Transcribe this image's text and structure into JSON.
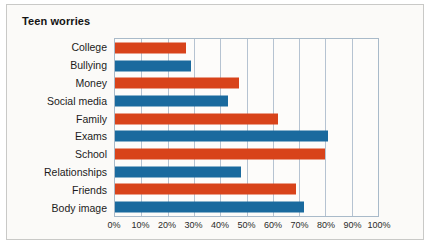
{
  "chart_data": {
    "type": "bar",
    "orientation": "horizontal",
    "title": "Teen worries",
    "xlabel": "",
    "ylabel": "",
    "categories": [
      "College",
      "Bullying",
      "Money",
      "Social media",
      "Family",
      "Exams",
      "School",
      "Relationships",
      "Friends",
      "Body image"
    ],
    "values": [
      27,
      29,
      47,
      43,
      62,
      81,
      80,
      48,
      69,
      72
    ],
    "bar_colors": [
      "#d8431a",
      "#1a6a9e",
      "#d8431a",
      "#1a6a9e",
      "#d8431a",
      "#1a6a9e",
      "#d8431a",
      "#1a6a9e",
      "#d8431a",
      "#1a6a9e"
    ],
    "xlim": [
      0,
      100
    ],
    "xticks": [
      0,
      10,
      20,
      30,
      40,
      50,
      60,
      70,
      80,
      90,
      100
    ],
    "xtick_labels": [
      "0%",
      "10%",
      "20%",
      "30%",
      "40%",
      "50%",
      "60%",
      "70%",
      "80%",
      "90%",
      "100%"
    ],
    "grid": true,
    "grid_color": "#b6c3d1",
    "legend": null,
    "accent_colors": {
      "orange": "#d8431a",
      "blue": "#1a6a9e",
      "border": "#c9c9c7",
      "background": "#fbfaf8"
    }
  }
}
